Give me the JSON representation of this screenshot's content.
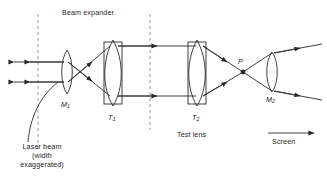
{
  "figure": {
    "type": "optical-ray-diagram",
    "background_color": "#ffffff",
    "line_color": "#2b2b2b",
    "dashed_color": "#9a9a9a",
    "labels": {
      "beam_expander": "Beam expander",
      "test_lens": "Test lens",
      "screen": "Screen",
      "laser_beam_l1": "Laser beam",
      "laser_beam_l2": "(width",
      "laser_beam_l3": "exaggerated)",
      "lens_m1": "M",
      "lens_m1_sub": "1",
      "lens_t1": "T",
      "lens_t1_sub": "1",
      "lens_t2": "T",
      "lens_t2_sub": "2",
      "lens_m2": "M",
      "lens_m2_sub": "2",
      "point_p": "P"
    },
    "components": [
      {
        "name": "lens-m1",
        "label": "M1",
        "kind": "biconvex-lens",
        "x": 67,
        "cy": 72
      },
      {
        "name": "lens-t1",
        "label": "T1",
        "kind": "biconvex-lens-mounted",
        "x": 113,
        "cy": 72
      },
      {
        "name": "lens-t2",
        "label": "T2",
        "kind": "biconvex-lens-mounted",
        "x": 197,
        "cy": 72
      },
      {
        "name": "lens-m2",
        "label": "M2",
        "kind": "biconvex-lens",
        "x": 272,
        "cy": 72
      },
      {
        "name": "point-p",
        "label": "P",
        "kind": "focal-point",
        "x": 243,
        "cy": 72
      }
    ],
    "dashed_lines": [
      {
        "x": 38
      },
      {
        "x": 150
      }
    ],
    "screen_arrow": {
      "from_x": 268,
      "to_x": 316,
      "y": 133
    }
  }
}
